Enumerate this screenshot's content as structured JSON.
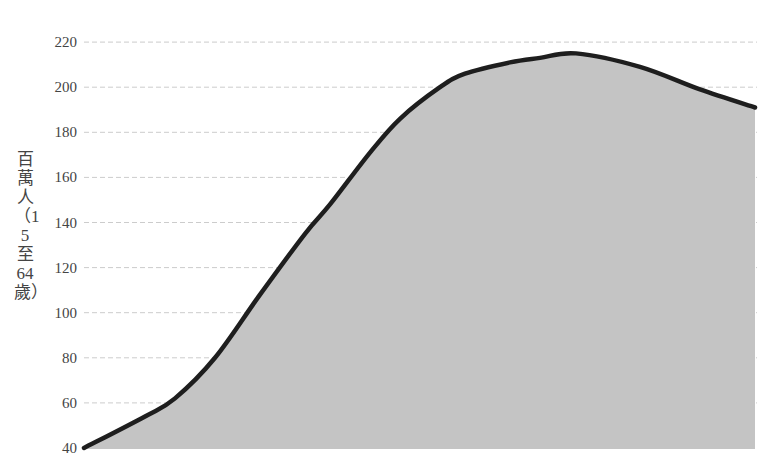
{
  "chart_data": {
    "type": "area",
    "title": "",
    "xlabel": "",
    "ylabel": "百萬人（15至64歲）",
    "ylim": [
      40,
      220
    ],
    "yticks": [
      40,
      60,
      80,
      100,
      120,
      140,
      160,
      180,
      200,
      220
    ],
    "grid": {
      "horizontal": true,
      "style": "dashed",
      "color": "#cccccc"
    },
    "legend": null,
    "x_pixels": [
      84,
      145,
      175,
      215,
      260,
      305,
      330,
      370,
      400,
      440,
      465,
      510,
      540,
      576,
      640,
      700,
      755
    ],
    "series": [
      {
        "name": "working-age population",
        "values": [
          40,
          54,
          62,
          80,
          108,
          135,
          148,
          171,
          186,
          200,
          206,
          211,
          213,
          215,
          209,
          199,
          191
        ],
        "line_color": "#1e1e1e",
        "fill_color": "#c4c4c4"
      }
    ]
  }
}
